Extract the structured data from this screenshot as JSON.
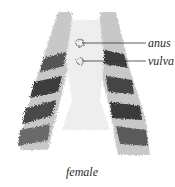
{
  "diagram": {
    "labels": [
      {
        "text": "anus"
      },
      {
        "text": "vulva"
      }
    ],
    "caption": "female"
  },
  "colors": {
    "background": "#ffffff",
    "fur_light": "#e4e4e4",
    "fur_mid": "#9a9a9a",
    "fur_dark": "#3c3c3c",
    "leader_line": "#333333",
    "text": "#2a2a2a"
  }
}
